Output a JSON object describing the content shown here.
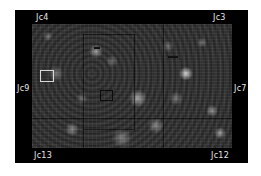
{
  "image": {
    "description": "Grayscale star field image with a black border frame and corner/edge labels",
    "frame_color": "#000000",
    "background_color": "#ffffff",
    "label_color": "#e6e6e6"
  },
  "labels": {
    "top_left": "Jc4",
    "top_right": "Jc3",
    "middle_left": "Jc9",
    "middle_right": "Jc7",
    "bottom_left": "Jc13",
    "bottom_right": "Jc12"
  },
  "markers": [
    {
      "name": "white-square",
      "color": "#d8d8d8"
    },
    {
      "name": "dark-square",
      "color": "#0c0c0c"
    }
  ]
}
